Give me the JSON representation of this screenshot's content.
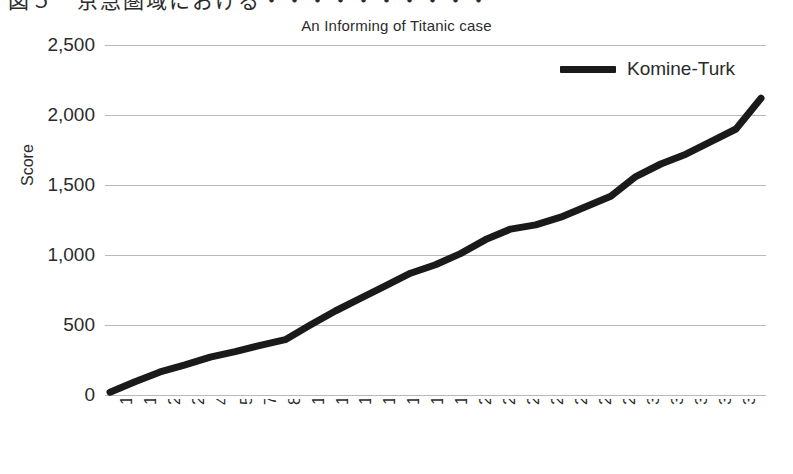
{
  "page": {
    "top_cropped_text": "図５　京急圏域における・・・・・・・・・・"
  },
  "chart_data": {
    "type": "line",
    "title": "An Informing of Titanic case",
    "xlabel": "",
    "ylabel": "Score",
    "grid": true,
    "legend_position": "top-right",
    "ylim": [
      0,
      2500
    ],
    "yticks": [
      0,
      500,
      1000,
      1500,
      2000,
      2500
    ],
    "ytick_labels": [
      "0",
      "500",
      "1,000",
      "1,500",
      "2,000",
      "2,500"
    ],
    "xtick_labels": [
      "1",
      "149",
      "297",
      "297",
      "445",
      "593",
      "741",
      "889",
      "1,037",
      "1,185",
      "1,333",
      "1,484",
      "1,629",
      "1,777",
      "1,925",
      "2,073",
      "2,221",
      "2,369",
      "2,517",
      "2,665",
      "2,813",
      "2,961",
      "3,109",
      "3,257",
      "3,405",
      "3,553",
      "3,701"
    ],
    "series": [
      {
        "name": "Komine-Turk",
        "color": "#1a1a1a",
        "x": [
          1,
          149,
          297,
          297,
          445,
          593,
          741,
          889,
          1037,
          1185,
          1333,
          1484,
          1629,
          1777,
          1925,
          2073,
          2221,
          2369,
          2517,
          2665,
          2813,
          2961,
          3109,
          3257,
          3405,
          3553,
          3701
        ],
        "values": [
          20,
          95,
          165,
          215,
          270,
          310,
          355,
          395,
          500,
          600,
          690,
          780,
          870,
          930,
          1010,
          1110,
          1185,
          1215,
          1270,
          1345,
          1420,
          1560,
          1650,
          1720,
          1810,
          1900,
          2005
        ]
      }
    ],
    "series_endpoint_value": 2120
  }
}
